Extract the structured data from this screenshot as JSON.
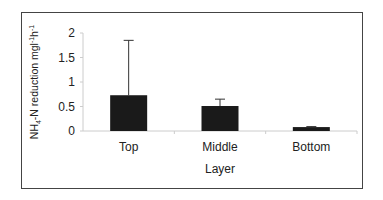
{
  "chart_data": {
    "type": "bar",
    "title": "",
    "xlabel": "Layer",
    "ylabel": "NH4-N reduction mgl-1h-1",
    "ylabel_parts": {
      "a": "NH",
      "sub": "4",
      "b": "-N reduction mgl",
      "sup1": "-1",
      "c": "h",
      "sup2": "-1"
    },
    "categories": [
      "Top",
      "Middle",
      "Bottom"
    ],
    "values": [
      0.73,
      0.51,
      0.08
    ],
    "error_upper": [
      1.85,
      0.65,
      0.09
    ],
    "yticks": [
      "0",
      "0.5",
      "1",
      "1.5",
      "2"
    ],
    "ylim": [
      0,
      2
    ],
    "grid": false,
    "legend": null,
    "bar_color": "#1a1a1a"
  }
}
